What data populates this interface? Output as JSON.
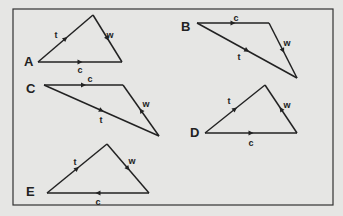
{
  "figure": {
    "background": "#e6e6e4",
    "line_color": "#222222",
    "frame": {
      "x": 13,
      "y": 9,
      "w": 320,
      "h": 196
    }
  },
  "triangles": [
    {
      "id": "A",
      "vertex_label": {
        "text": "A",
        "x": 24,
        "y": 66
      },
      "points": [
        [
          38,
          62
        ],
        [
          93,
          15
        ],
        [
          122,
          62
        ]
      ],
      "sides": [
        {
          "name": "t",
          "from": [
            38,
            62
          ],
          "to": [
            93,
            15
          ],
          "arrow": "forward",
          "label": {
            "text": "t",
            "x": 56,
            "y": 38
          }
        },
        {
          "name": "w",
          "from": [
            93,
            15
          ],
          "to": [
            122,
            62
          ],
          "arrow": "forward",
          "label": {
            "text": "w",
            "x": 110,
            "y": 38
          }
        },
        {
          "name": "c",
          "from": [
            38,
            62
          ],
          "to": [
            122,
            62
          ],
          "arrow": "forward",
          "label": {
            "text": "c",
            "x": 80,
            "y": 73
          }
        }
      ]
    },
    {
      "id": "B",
      "vertex_label": {
        "text": "B",
        "x": 181,
        "y": 31
      },
      "points": [
        [
          197,
          23
        ],
        [
          269,
          23
        ],
        [
          297,
          78
        ]
      ],
      "sides": [
        {
          "name": "c",
          "from": [
            197,
            23
          ],
          "to": [
            269,
            23
          ],
          "arrow": "forward",
          "label": {
            "text": "c",
            "x": 236,
            "y": 21
          }
        },
        {
          "name": "w",
          "from": [
            269,
            23
          ],
          "to": [
            297,
            78
          ],
          "arrow": "forward",
          "label": {
            "text": "w",
            "x": 287,
            "y": 46
          }
        },
        {
          "name": "t",
          "from": [
            197,
            23
          ],
          "to": [
            297,
            78
          ],
          "arrow": "forward",
          "label": {
            "text": "t",
            "x": 239,
            "y": 60
          }
        }
      ]
    },
    {
      "id": "C",
      "vertex_label": {
        "text": "C",
        "x": 26,
        "y": 93
      },
      "points": [
        [
          44,
          85
        ],
        [
          123,
          85
        ],
        [
          159,
          136
        ]
      ],
      "sides": [
        {
          "name": "c",
          "from": [
            44,
            85
          ],
          "to": [
            123,
            85
          ],
          "arrow": "forward",
          "label": {
            "text": "c",
            "x": 90,
            "y": 82
          }
        },
        {
          "name": "w",
          "from": [
            123,
            85
          ],
          "to": [
            159,
            136
          ],
          "arrow": "backward",
          "label": {
            "text": "w",
            "x": 146,
            "y": 107
          }
        },
        {
          "name": "t",
          "from": [
            44,
            85
          ],
          "to": [
            159,
            136
          ],
          "arrow": "forward",
          "label": {
            "text": "t",
            "x": 101,
            "y": 123
          }
        }
      ]
    },
    {
      "id": "D",
      "vertex_label": {
        "text": "D",
        "x": 190,
        "y": 137
      },
      "points": [
        [
          205,
          133
        ],
        [
          265,
          85
        ],
        [
          297,
          133
        ]
      ],
      "sides": [
        {
          "name": "t",
          "from": [
            205,
            133
          ],
          "to": [
            265,
            85
          ],
          "arrow": "forward",
          "label": {
            "text": "t",
            "x": 229,
            "y": 104
          }
        },
        {
          "name": "w",
          "from": [
            297,
            133
          ],
          "to": [
            265,
            85
          ],
          "arrow": "forward",
          "label": {
            "text": "w",
            "x": 287,
            "y": 108
          }
        },
        {
          "name": "c",
          "from": [
            205,
            133
          ],
          "to": [
            297,
            133
          ],
          "arrow": "forward",
          "label": {
            "text": "c",
            "x": 251,
            "y": 146
          }
        }
      ]
    },
    {
      "id": "E",
      "vertex_label": {
        "text": "E",
        "x": 26,
        "y": 196
      },
      "points": [
        [
          47,
          193
        ],
        [
          107,
          144
        ],
        [
          149,
          193
        ]
      ],
      "sides": [
        {
          "name": "t",
          "from": [
            47,
            193
          ],
          "to": [
            107,
            144
          ],
          "arrow": "forward",
          "label": {
            "text": "t",
            "x": 75,
            "y": 165
          }
        },
        {
          "name": "w",
          "from": [
            107,
            144
          ],
          "to": [
            149,
            193
          ],
          "arrow": "forward",
          "label": {
            "text": "w",
            "x": 132,
            "y": 164
          }
        },
        {
          "name": "c",
          "from": [
            149,
            193
          ],
          "to": [
            47,
            193
          ],
          "arrow": "forward",
          "label": {
            "text": "c",
            "x": 98,
            "y": 205
          }
        }
      ]
    }
  ]
}
